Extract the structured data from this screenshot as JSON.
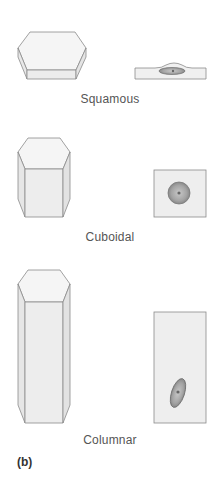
{
  "figure": {
    "panel_label": "(b)",
    "colors": {
      "outline": "#8a8a8a",
      "face_light": "#f4f4f4",
      "face_mid": "#ececec",
      "face_dark": "#e2e2e2",
      "nucleus": "#a9a9a9",
      "nucleus_dark": "#7a7a7a",
      "nucleolus": "#6a6a6a",
      "label_text": "#555555"
    },
    "cell_types": [
      {
        "name": "Squamous",
        "shape_3d": "flat-hexagonal-prism",
        "section": "flattened-cell-with-oval-nucleus"
      },
      {
        "name": "Cuboidal",
        "shape_3d": "short-hexagonal-prism",
        "section": "square-cell-with-round-nucleus"
      },
      {
        "name": "Columnar",
        "shape_3d": "tall-hexagonal-prism",
        "section": "tall-cell-with-elongated-basal-nucleus"
      }
    ]
  }
}
